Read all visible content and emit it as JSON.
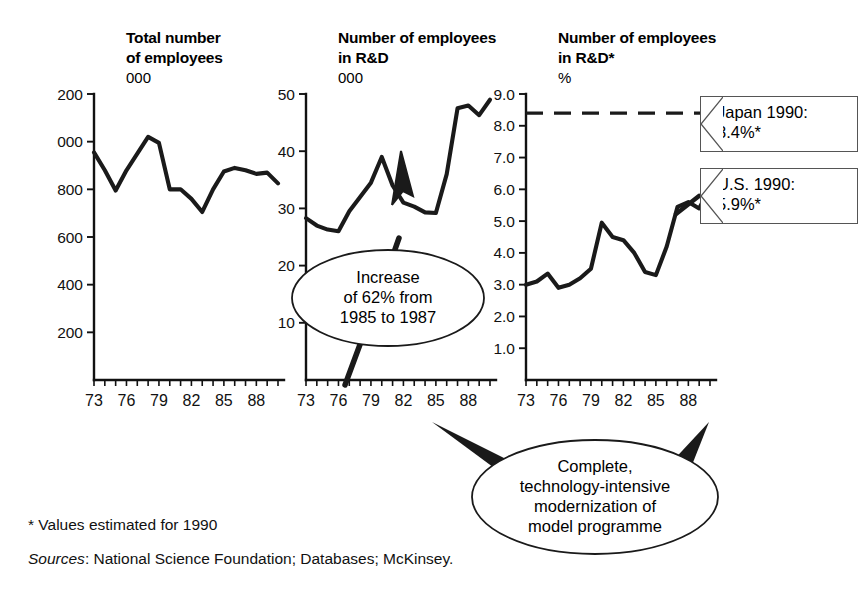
{
  "figure": {
    "footnote": "* Values estimated for 1990",
    "sources_label": "Sources",
    "sources_rest": ": National Science Foundation; Databases; McKinsey."
  },
  "annotations": {
    "japan": {
      "line1": "Japan 1990:",
      "line2": "8.4%*"
    },
    "us": {
      "line1": "U.S. 1990:",
      "line2": "5.9%*"
    },
    "increase": {
      "line1": "Increase",
      "line2": "of 62% from",
      "line3": "1985 to 1987"
    },
    "model": {
      "line1": "Complete,",
      "line2": "technology-intensive",
      "line3": "modernization of",
      "line4": "model programme"
    }
  },
  "chart_data": [
    {
      "type": "line",
      "title": "Total number of employees",
      "title_lines": [
        "Total number",
        "of employees"
      ],
      "unit": "000",
      "xlabel": "",
      "ylabel": "000",
      "ylim": [
        0,
        1200
      ],
      "yticks": [
        200,
        400,
        600,
        800,
        1000,
        1200
      ],
      "ytick_labels": [
        "200",
        "400",
        "600",
        "800",
        "1,000",
        "1,200"
      ],
      "grid": false,
      "x": [
        1973,
        1974,
        1975,
        1976,
        1977,
        1978,
        1979,
        1980,
        1981,
        1982,
        1983,
        1984,
        1985,
        1986,
        1987,
        1988,
        1989,
        1990
      ],
      "xtick_labels": [
        "73",
        "76",
        "79",
        "82",
        "85",
        "88"
      ],
      "xtick_values": [
        1973,
        1976,
        1979,
        1982,
        1985,
        1988
      ],
      "values": [
        955,
        880,
        795,
        880,
        950,
        1020,
        995,
        800,
        800,
        760,
        705,
        800,
        875,
        890,
        880,
        865,
        870,
        825
      ]
    },
    {
      "type": "line",
      "title": "Number of employees in R&D",
      "title_lines": [
        "Number of employees",
        "in R&D"
      ],
      "unit": "000",
      "xlabel": "",
      "ylabel": "000",
      "ylim": [
        0,
        50
      ],
      "yticks": [
        10,
        20,
        30,
        40,
        50
      ],
      "ytick_labels": [
        "10",
        "20",
        "30",
        "40",
        "50"
      ],
      "grid": false,
      "x": [
        1973,
        1974,
        1975,
        1976,
        1977,
        1978,
        1979,
        1980,
        1981,
        1982,
        1983,
        1984,
        1985,
        1986,
        1987,
        1988,
        1989,
        1990
      ],
      "xtick_labels": [
        "73",
        "76",
        "79",
        "82",
        "85",
        "88"
      ],
      "xtick_values": [
        1973,
        1976,
        1979,
        1982,
        1985,
        1988
      ],
      "values": [
        28.3,
        27.0,
        26.3,
        26.0,
        29.5,
        32.0,
        34.5,
        39.0,
        34.0,
        31.0,
        30.3,
        29.3,
        29.2,
        36.0,
        47.5,
        48.0,
        46.3,
        49.0
      ]
    },
    {
      "type": "line",
      "title": "Number of employees in R&D*",
      "title_lines": [
        "Number of employees",
        "in R&D*"
      ],
      "unit": "%",
      "xlabel": "",
      "ylabel": "%",
      "ylim": [
        0,
        9.0
      ],
      "yticks": [
        1.0,
        2.0,
        3.0,
        4.0,
        5.0,
        6.0,
        7.0,
        8.0,
        9.0
      ],
      "ytick_labels": [
        "1.0",
        "2.0",
        "3.0",
        "4.0",
        "5.0",
        "6.0",
        "7.0",
        "8.0",
        "9.0"
      ],
      "grid": false,
      "x": [
        1973,
        1974,
        1975,
        1976,
        1977,
        1978,
        1979,
        1980,
        1981,
        1982,
        1983,
        1984,
        1985,
        1986,
        1987,
        1988,
        1989,
        1990
      ],
      "xtick_labels": [
        "73",
        "76",
        "79",
        "82",
        "85",
        "88"
      ],
      "xtick_values": [
        1973,
        1976,
        1979,
        1982,
        1985,
        1988
      ],
      "values": [
        3.0,
        3.1,
        3.35,
        2.9,
        3.0,
        3.2,
        3.5,
        4.95,
        4.5,
        4.4,
        4.0,
        3.4,
        3.3,
        4.2,
        5.45,
        5.6,
        5.4,
        6.05
      ],
      "reference_line": {
        "label": "Japan 1990",
        "value": 8.4
      }
    }
  ]
}
